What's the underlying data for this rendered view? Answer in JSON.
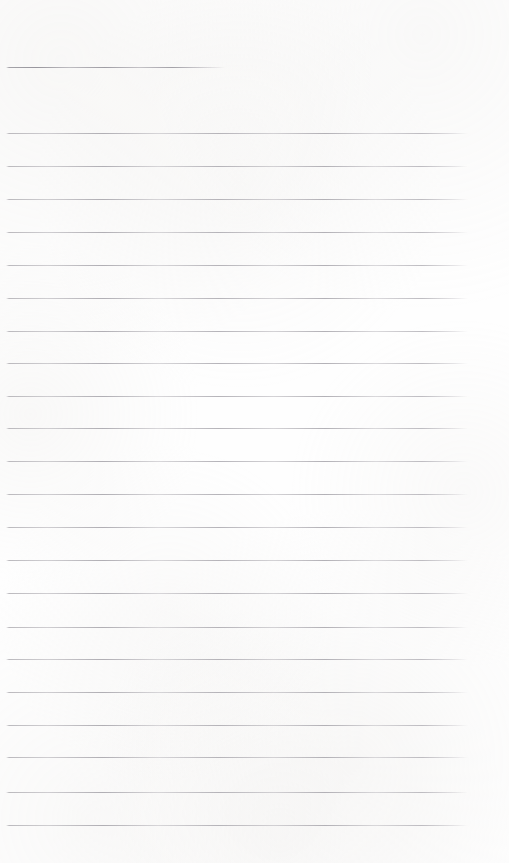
{
  "document": {
    "kind": "scanned-lined-paper",
    "title": "Blank Ruled Notebook Page",
    "description": "A scanned blank sheet of ruled writing paper with no handwriting or printed text.",
    "page_width": 509,
    "page_height": 863,
    "background_color": "#fefefe",
    "rule_color": "#c4c2c6",
    "rule_color_emphasis": "#9c9aa1",
    "text_content": "",
    "body_rule_left": 6,
    "body_rule_right": 468,
    "rule_spacing": 32.8,
    "rules": [
      {
        "id": "rule-1",
        "y": 67,
        "x": 6,
        "width": 219,
        "variant": "short",
        "label": "header-rule"
      },
      {
        "id": "rule-2",
        "y": 133,
        "x": 6,
        "width": 462,
        "variant": "full",
        "label": "body-rule"
      },
      {
        "id": "rule-3",
        "y": 166,
        "x": 6,
        "width": 462,
        "variant": "full",
        "label": "body-rule"
      },
      {
        "id": "rule-4",
        "y": 199,
        "x": 6,
        "width": 462,
        "variant": "full",
        "label": "body-rule"
      },
      {
        "id": "rule-5",
        "y": 232,
        "x": 6,
        "width": 462,
        "variant": "full",
        "label": "body-rule"
      },
      {
        "id": "rule-6",
        "y": 265,
        "x": 6,
        "width": 462,
        "variant": "full",
        "label": "body-rule"
      },
      {
        "id": "rule-7",
        "y": 298,
        "x": 6,
        "width": 462,
        "variant": "full",
        "label": "body-rule"
      },
      {
        "id": "rule-8",
        "y": 331,
        "x": 6,
        "width": 462,
        "variant": "full",
        "label": "body-rule"
      },
      {
        "id": "rule-9",
        "y": 363,
        "x": 6,
        "width": 462,
        "variant": "full",
        "label": "body-rule"
      },
      {
        "id": "rule-10",
        "y": 396,
        "x": 6,
        "width": 462,
        "variant": "full",
        "label": "body-rule"
      },
      {
        "id": "rule-11",
        "y": 428,
        "x": 6,
        "width": 462,
        "variant": "full",
        "label": "body-rule"
      },
      {
        "id": "rule-12",
        "y": 461,
        "x": 6,
        "width": 462,
        "variant": "full",
        "label": "body-rule"
      },
      {
        "id": "rule-13",
        "y": 494,
        "x": 6,
        "width": 462,
        "variant": "full",
        "label": "body-rule"
      },
      {
        "id": "rule-14",
        "y": 527,
        "x": 6,
        "width": 462,
        "variant": "full",
        "label": "body-rule"
      },
      {
        "id": "rule-15",
        "y": 560,
        "x": 6,
        "width": 462,
        "variant": "full",
        "label": "body-rule"
      },
      {
        "id": "rule-16",
        "y": 593,
        "x": 6,
        "width": 462,
        "variant": "full",
        "label": "body-rule"
      },
      {
        "id": "rule-17",
        "y": 627,
        "x": 6,
        "width": 462,
        "variant": "full",
        "label": "body-rule"
      },
      {
        "id": "rule-18",
        "y": 659,
        "x": 6,
        "width": 462,
        "variant": "full",
        "label": "body-rule"
      },
      {
        "id": "rule-19",
        "y": 692,
        "x": 6,
        "width": 462,
        "variant": "full",
        "label": "body-rule"
      },
      {
        "id": "rule-20",
        "y": 725,
        "x": 6,
        "width": 462,
        "variant": "full",
        "label": "body-rule"
      },
      {
        "id": "rule-21",
        "y": 757,
        "x": 6,
        "width": 462,
        "variant": "full",
        "label": "body-rule"
      },
      {
        "id": "rule-22",
        "y": 792,
        "x": 6,
        "width": 462,
        "variant": "full",
        "label": "body-rule"
      },
      {
        "id": "rule-23",
        "y": 825,
        "x": 6,
        "width": 462,
        "variant": "full",
        "label": "body-rule"
      }
    ]
  }
}
